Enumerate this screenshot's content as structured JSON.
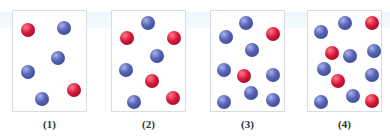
{
  "figure": {
    "panels": [
      {
        "label": "(1)",
        "balls": [
          {
            "color": "red",
            "x": 15,
            "y": 19
          },
          {
            "color": "blue",
            "x": 51,
            "y": 17
          },
          {
            "color": "blue",
            "x": 45,
            "y": 47
          },
          {
            "color": "blue",
            "x": 15,
            "y": 61
          },
          {
            "color": "red",
            "x": 61,
            "y": 79
          },
          {
            "color": "blue",
            "x": 29,
            "y": 88
          }
        ]
      },
      {
        "label": "(2)",
        "balls": [
          {
            "color": "blue",
            "x": 36,
            "y": 12
          },
          {
            "color": "red",
            "x": 15,
            "y": 27
          },
          {
            "color": "red",
            "x": 62,
            "y": 27
          },
          {
            "color": "blue",
            "x": 45,
            "y": 45
          },
          {
            "color": "blue",
            "x": 14,
            "y": 59
          },
          {
            "color": "red",
            "x": 40,
            "y": 70
          },
          {
            "color": "blue",
            "x": 22,
            "y": 91
          },
          {
            "color": "red",
            "x": 61,
            "y": 87
          }
        ]
      },
      {
        "label": "(3)",
        "balls": [
          {
            "color": "blue",
            "x": 35,
            "y": 12
          },
          {
            "color": "blue",
            "x": 15,
            "y": 26
          },
          {
            "color": "red",
            "x": 62,
            "y": 23
          },
          {
            "color": "blue",
            "x": 41,
            "y": 39
          },
          {
            "color": "blue",
            "x": 13,
            "y": 59
          },
          {
            "color": "red",
            "x": 33,
            "y": 65
          },
          {
            "color": "blue",
            "x": 62,
            "y": 64
          },
          {
            "color": "blue",
            "x": 40,
            "y": 82
          },
          {
            "color": "blue",
            "x": 13,
            "y": 91
          },
          {
            "color": "blue",
            "x": 62,
            "y": 89
          }
        ]
      },
      {
        "label": "(4)",
        "balls": [
          {
            "color": "blue",
            "x": 37,
            "y": 12
          },
          {
            "color": "red",
            "x": 64,
            "y": 12
          },
          {
            "color": "blue",
            "x": 13,
            "y": 21
          },
          {
            "color": "red",
            "x": 24,
            "y": 42
          },
          {
            "color": "blue",
            "x": 42,
            "y": 45
          },
          {
            "color": "blue",
            "x": 66,
            "y": 40
          },
          {
            "color": "blue",
            "x": 16,
            "y": 58
          },
          {
            "color": "red",
            "x": 30,
            "y": 70
          },
          {
            "color": "blue",
            "x": 64,
            "y": 64
          },
          {
            "color": "blue",
            "x": 45,
            "y": 85
          },
          {
            "color": "blue",
            "x": 13,
            "y": 91
          },
          {
            "color": "red",
            "x": 64,
            "y": 90
          }
        ]
      }
    ],
    "colors": {
      "red": "#d9163a",
      "blue": "#4f5cb0",
      "border": "#d6dde4"
    }
  }
}
